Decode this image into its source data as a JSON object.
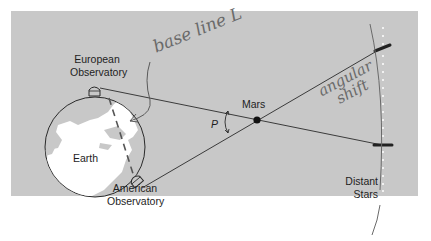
{
  "diagram": {
    "labels": {
      "european_line1": "European",
      "european_line2": "Observatory",
      "american_line1": "American",
      "american_line2": "Observatory",
      "earth": "Earth",
      "mars": "Mars",
      "parallax_angle": "P",
      "stars_line1": "Distant",
      "stars_line2": "Stars"
    },
    "annotations": {
      "baseline": "base line L",
      "shift_line1": "angular",
      "shift_line2": "shift"
    },
    "colors": {
      "panel": "#c8c8c8",
      "ink": "#2a2a2a",
      "handwriting": "#6a6a6a",
      "land": "#ffffff",
      "ocean": "#c8c8c8"
    }
  }
}
